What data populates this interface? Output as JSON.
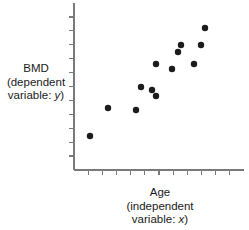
{
  "figure": {
    "name": "bmd-vs-age-scatter",
    "background_color": "#ffffff",
    "point_color": "#1c1c1c",
    "axis_color": "#7a7a7a"
  },
  "ylabel": {
    "line1": "BMD",
    "line2_prefix": "(dependent",
    "line3_prefix": "variable: ",
    "line3_variable": "y",
    "line3_suffix": ")"
  },
  "xlabel": {
    "line1": "Age",
    "line2_prefix": "(independent",
    "line3_prefix": "variable: ",
    "line3_variable": "x",
    "line3_suffix": ")"
  },
  "chart_data": {
    "type": "scatter",
    "title": "",
    "xlabel": "Age (independent variable: x)",
    "ylabel": "BMD (dependent variable: y)",
    "xlabel_short": "Age",
    "ylabel_short": "BMD",
    "x_variable_symbol": "x",
    "y_variable_symbol": "y",
    "grid": false,
    "legend": false,
    "x_tick_labels": [],
    "y_tick_labels": [],
    "x_tick_count": 11,
    "y_tick_count": 11,
    "x_tick_direction": "outward-down",
    "y_tick_direction": "outward-left",
    "xlim": [
      0,
      1
    ],
    "ylim": [
      0,
      1
    ],
    "n_points": 13,
    "relationship": "positive",
    "points_px": [
      {
        "x": 90,
        "y": 136
      },
      {
        "x": 108,
        "y": 108
      },
      {
        "x": 136,
        "y": 110
      },
      {
        "x": 141,
        "y": 87
      },
      {
        "x": 152,
        "y": 90
      },
      {
        "x": 156,
        "y": 96
      },
      {
        "x": 156,
        "y": 64
      },
      {
        "x": 172,
        "y": 69
      },
      {
        "x": 178,
        "y": 52
      },
      {
        "x": 181,
        "y": 45
      },
      {
        "x": 194,
        "y": 64
      },
      {
        "x": 201,
        "y": 45
      },
      {
        "x": 205,
        "y": 28
      }
    ],
    "points_normalized": [
      {
        "x": 0.094,
        "y": 0.204
      },
      {
        "x": 0.2,
        "y": 0.371
      },
      {
        "x": 0.365,
        "y": 0.359
      },
      {
        "x": 0.394,
        "y": 0.497
      },
      {
        "x": 0.459,
        "y": 0.479
      },
      {
        "x": 0.482,
        "y": 0.443
      },
      {
        "x": 0.482,
        "y": 0.635
      },
      {
        "x": 0.576,
        "y": 0.605
      },
      {
        "x": 0.612,
        "y": 0.707
      },
      {
        "x": 0.629,
        "y": 0.749
      },
      {
        "x": 0.706,
        "y": 0.635
      },
      {
        "x": 0.747,
        "y": 0.749
      },
      {
        "x": 0.771,
        "y": 0.85
      }
    ]
  },
  "geometry": {
    "axis_x": 74,
    "axis_y": 170,
    "axis_top": 3,
    "axis_right": 244,
    "tick_len": 5,
    "dot_radius": 3.2
  }
}
